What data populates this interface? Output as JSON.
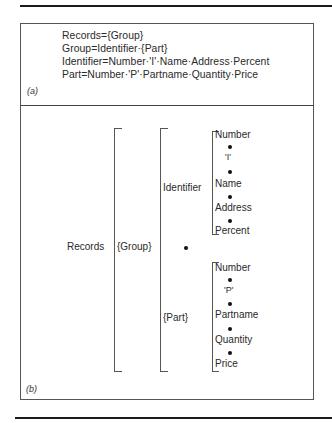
{
  "figure": {
    "panel_a": {
      "label": "(a)",
      "rules": [
        "Records={Group}",
        "Group=Identifier·{Part}",
        "Identifier=Number·'I'·Name·Address·Percent",
        "Part=Number·'P'·Partname·Quantity·Price"
      ]
    },
    "panel_b": {
      "label": "(b)",
      "root": "Records",
      "group": "{Group}",
      "identifier": {
        "label": "Identifier",
        "items": [
          "Number",
          "'I'",
          "Name",
          "Address",
          "Percent"
        ]
      },
      "sequence_dot": "•",
      "part": {
        "label": "{Part}",
        "items": [
          "Number",
          "'P'",
          "Partname",
          "Quantity",
          "Price"
        ]
      }
    }
  }
}
